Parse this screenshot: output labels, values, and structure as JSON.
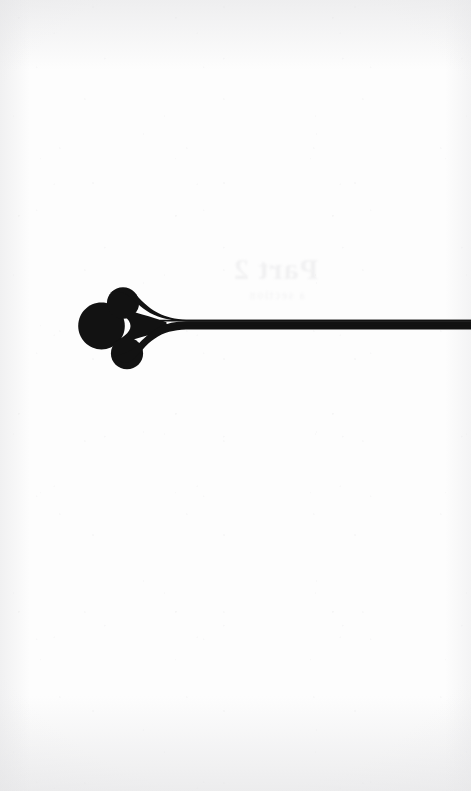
{
  "page": {
    "kind": "scanned-book-page",
    "role": "section-divider-recto",
    "width": 471,
    "height": 791,
    "paper_color": "#fdfdfd",
    "ink_color": "#111111",
    "body_text": "",
    "page_number": "",
    "running_head": ""
  },
  "ornament": {
    "name": "fleuron-headpiece",
    "description": "Printer's fleuron of three teardrop lobes tapering rightward into a double rule",
    "lobe_count": 3,
    "ink_color": "#121212",
    "bounds": {
      "x": 78,
      "y": 287,
      "width": 88,
      "height": 83
    },
    "lobes": [
      {
        "name": "left-lobe",
        "cx": 101,
        "cy": 326,
        "r": 23
      },
      {
        "name": "upper-lobe",
        "cx": 123,
        "cy": 300,
        "r": 15
      },
      {
        "name": "lower-lobe",
        "cx": 127,
        "cy": 353,
        "r": 15
      }
    ]
  },
  "rule": {
    "name": "double-rule",
    "style": "double",
    "line_count": 2,
    "ink_color": "#121212",
    "start_x": 78,
    "end_x": 471,
    "upper_line_y": 320.6,
    "lower_line_y": 324.8,
    "line_thickness": 1.7,
    "gap": 2.5,
    "bleeds_off_right_edge": true
  },
  "showthrough": {
    "visible": true,
    "note": "faint mirrored bleed-through of type printed on the verso",
    "title_ghost": "Part 2",
    "subtitle_ghost": "a section",
    "opacity": 0.085
  }
}
